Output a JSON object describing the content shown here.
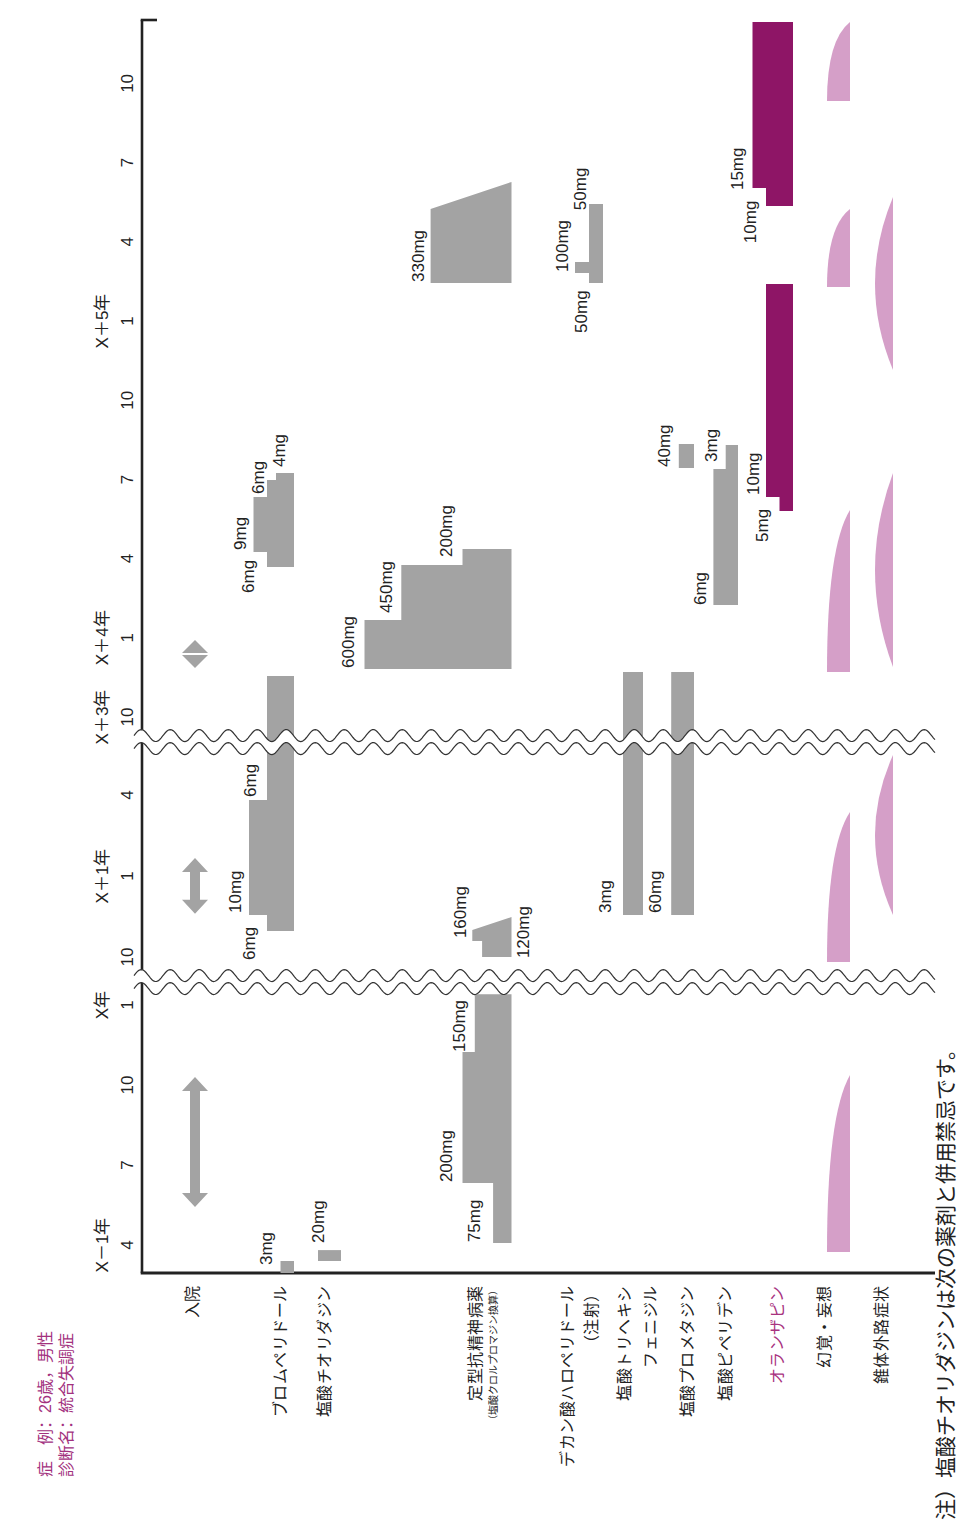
{
  "page": {
    "case_line": "症　例：26歳，男性",
    "diagnosis_line": "診断名：統合失調症",
    "note": "注）塩酸チオリダジンは次の薬剤と併用禁忌です。"
  },
  "chart_data": {
    "type": "bar",
    "subtype": "clinical-course-timeline",
    "xlabel": "",
    "ylabel": "",
    "colors": {
      "drug": "#a3a3a3",
      "olanzapine": "#8e1566",
      "symptom": "#d59fc8",
      "accent_text": "#a2317e",
      "axis": "#222222",
      "break_line": "#333333"
    },
    "time_axis": {
      "unit": "month",
      "range": [
        1.95,
        83.4
      ],
      "breaks": [
        [
          12.86,
          20.07
        ],
        [
          28.96,
          56.05
        ]
      ],
      "ticks": [
        {
          "t": 3,
          "month": "4",
          "year": "X－1年"
        },
        {
          "t": 6,
          "month": "7"
        },
        {
          "t": 9,
          "month": "10"
        },
        {
          "t": 12,
          "month": "1",
          "year": "X年"
        },
        {
          "t": 21,
          "month": "10"
        },
        {
          "t": 24,
          "month": "1",
          "year": "X＋1年"
        },
        {
          "t": 27,
          "month": "4"
        },
        {
          "t": 57,
          "month": "10",
          "year": "X＋3年"
        },
        {
          "t": 60,
          "month": "1",
          "year": "X＋4年"
        },
        {
          "t": 63,
          "month": "4"
        },
        {
          "t": 66,
          "month": "7"
        },
        {
          "t": 69,
          "month": "10"
        },
        {
          "t": 72,
          "month": "1",
          "year": "X＋5年"
        },
        {
          "t": 75,
          "month": "4"
        },
        {
          "t": 78,
          "month": "7"
        },
        {
          "t": 81,
          "month": "10"
        }
      ]
    },
    "rows": [
      {
        "id": "admission",
        "label_lines": [
          "入院"
        ],
        "kind": "arrow",
        "items": [
          {
            "t0": 4.43,
            "t1": 9.3
          },
          {
            "t0": 22.6,
            "t1": 24.67
          },
          {
            "t0": 58.86,
            "t1": 59.92
          }
        ]
      },
      {
        "id": "bromperidol",
        "label_lines": [
          "ブロムペリドール"
        ],
        "kind": "dose",
        "unit": "mg",
        "steps": [
          {
            "t0": 1.95,
            "t1": 2.4,
            "dose": 3
          },
          {
            "t0": 21.96,
            "t1": 22.56,
            "dose": 6
          },
          {
            "t0": 22.56,
            "t1": 26.81,
            "dose": 10
          },
          {
            "t0": 26.81,
            "t1": 58.55,
            "dose": 6
          },
          {
            "t0": 62.68,
            "t1": 63.25,
            "dose": 6
          },
          {
            "t0": 63.25,
            "t1": 65.33,
            "dose": 9
          },
          {
            "t0": 65.33,
            "t1": 65.98,
            "dose": 6
          },
          {
            "t0": 65.98,
            "t1": 66.24,
            "dose": 4
          }
        ],
        "labels": [
          {
            "text": "3mg",
            "t": 2.25,
            "level": 6.2
          },
          {
            "text": "6mg",
            "t": 20.89,
            "level": 10
          },
          {
            "text": "10mg",
            "t": 22.63,
            "level": 13.1
          },
          {
            "text": "6mg",
            "t": 26.93,
            "level": 9.8
          },
          {
            "text": "6mg",
            "t": 61.7,
            "level": 10.2
          },
          {
            "text": "9mg",
            "t": 63.33,
            "level": 12
          },
          {
            "text": "6mg",
            "t": 65.45,
            "level": 8
          },
          {
            "text": "4mg",
            "t": 66.47,
            "level": 3.3
          }
        ]
      },
      {
        "id": "thioridazine",
        "label_lines": [
          "塩酸チオリダジン"
        ],
        "kind": "dose",
        "unit": "mg",
        "steps": [
          {
            "t0": 2.4,
            "t1": 2.81,
            "dose": 20
          }
        ],
        "labels": [
          {
            "text": "20mg",
            "t": 3.08,
            "level": 20
          }
        ]
      },
      {
        "id": "typical-antipsychotics-cp-equivalent",
        "label_lines": [
          "定型抗精神病薬",
          "（塩酸クロルプロマジン換算）"
        ],
        "kind": "dose",
        "unit": "mg",
        "steps": [
          {
            "t0": 3.08,
            "t1": 5.33,
            "dose": 75
          },
          {
            "t0": 5.33,
            "t1": 10.24,
            "dose": 200
          },
          {
            "t0": 10.24,
            "t1": 12.4,
            "dose": 150
          },
          {
            "t0": 21.0,
            "t1": 21.59,
            "dose": 120
          },
          {
            "t0": 21.59,
            "t1": 22.0,
            "dose": 160
          },
          {
            "t0": 22.0,
            "t1": 22.48,
            "dose": 160,
            "dose_end": 0
          },
          {
            "t0": 58.82,
            "t1": 60.67,
            "dose": 600
          },
          {
            "t0": 60.67,
            "t1": 62.76,
            "dose": 450
          },
          {
            "t0": 62.76,
            "t1": 63.36,
            "dose": 200
          },
          {
            "t0": 73.44,
            "t1": 76.24,
            "dose": 330
          },
          {
            "t0": 76.24,
            "t1": 77.27,
            "dose": 330,
            "dose_end": 0
          }
        ],
        "labels": [
          {
            "text": "75mg",
            "t": 3.11,
            "level": 153
          },
          {
            "text": "200mg",
            "t": 5.36,
            "level": 267
          },
          {
            "text": "150mg",
            "t": 10.24,
            "level": 214
          },
          {
            "text": "120mg",
            "t": 20.96,
            "level": -47
          },
          {
            "text": "160mg",
            "t": 21.7,
            "level": 210
          },
          {
            "text": "600mg",
            "t": 58.86,
            "level": 667
          },
          {
            "text": "450mg",
            "t": 60.94,
            "level": 512
          },
          {
            "text": "200mg",
            "t": 63.06,
            "level": 267
          },
          {
            "text": "330mg",
            "t": 73.48,
            "level": 382
          }
        ]
      },
      {
        "id": "haloperidol-decanoate",
        "label_lines": [
          "デカン酸ハロペリドール",
          "（注射）"
        ],
        "kind": "dose",
        "unit": "mg",
        "steps": [
          {
            "t0": 73.44,
            "t1": 73.82,
            "dose": 50
          },
          {
            "t0": 73.82,
            "t1": 74.23,
            "dose": 100
          },
          {
            "t0": 74.23,
            "t1": 76.43,
            "dose": 50
          }
        ],
        "labels": [
          {
            "text": "50mg",
            "t": 71.55,
            "level": 79
          },
          {
            "text": "100mg",
            "t": 73.86,
            "level": 146
          },
          {
            "text": "50mg",
            "t": 76.2,
            "level": 82
          }
        ]
      },
      {
        "id": "trihexyphenidyl",
        "label_lines": [
          "塩酸トリヘキシ",
          "フェニジル"
        ],
        "kind": "dose",
        "unit": "mg",
        "steps": [
          {
            "t0": 22.56,
            "t1": 58.7,
            "dose": 3
          }
        ],
        "labels": [
          {
            "text": "3mg",
            "t": 22.63,
            "level": 5.7
          }
        ]
      },
      {
        "id": "promethazine",
        "label_lines": [
          "塩酸プロメタジン"
        ],
        "kind": "dose",
        "unit": "mg",
        "steps": [
          {
            "t0": 22.56,
            "t1": 58.7,
            "dose": 60
          },
          {
            "t0": 66.43,
            "t1": 67.34,
            "dose": 40
          }
        ],
        "labels": [
          {
            "text": "60mg",
            "t": 22.63,
            "level": 103
          },
          {
            "text": "40mg",
            "t": 66.47,
            "level": 79
          }
        ]
      },
      {
        "id": "biperiden",
        "label_lines": [
          "塩酸ピペリデン"
        ],
        "kind": "dose",
        "unit": "mg",
        "steps": [
          {
            "t0": 61.24,
            "t1": 66.39,
            "dose": 6
          },
          {
            "t0": 66.39,
            "t1": 67.3,
            "dose": 3
          }
        ],
        "labels": [
          {
            "text": "6mg",
            "t": 61.24,
            "level": 9.3
          },
          {
            "text": "3mg",
            "t": 66.66,
            "level": 6.6
          }
        ]
      },
      {
        "id": "olanzapine",
        "label_lines": [
          "オランザピン"
        ],
        "kind": "dose",
        "unit": "mg",
        "steps": [
          {
            "t0": 64.8,
            "t1": 65.33,
            "dose": 5
          },
          {
            "t0": 65.33,
            "t1": 73.4,
            "dose": 10
          },
          {
            "t0": 76.36,
            "t1": 77.04,
            "dose": 10
          },
          {
            "t0": 77.04,
            "t1": 83.33,
            "dose": 15
          }
        ],
        "labels": [
          {
            "text": "5mg",
            "t": 63.63,
            "level": 11.5
          },
          {
            "text": "10mg",
            "t": 65.41,
            "level": 14.8
          },
          {
            "text": "10mg",
            "t": 74.95,
            "level": 15.9
          },
          {
            "text": "15mg",
            "t": 76.96,
            "level": 20.7
          }
        ]
      },
      {
        "id": "hallucination-delusion",
        "label_lines": [
          "幻覚・妄想"
        ],
        "kind": "wedge",
        "items": [
          {
            "t0": 2.74,
            "t1": 9.38
          },
          {
            "t0": 20.81,
            "t1": 26.37
          },
          {
            "t0": 58.7,
            "t1": 64.84
          },
          {
            "t0": 73.29,
            "t1": 76.24
          },
          {
            "t0": 80.33,
            "t1": 83.33
          }
        ]
      },
      {
        "id": "extrapyramidal-symptoms",
        "label_lines": [
          "錐体外路症状"
        ],
        "kind": "lens",
        "items": [
          {
            "t0": 22.56,
            "t1": 28.48
          },
          {
            "t0": 58.89,
            "t1": 66.24
          },
          {
            "t0": 70.14,
            "t1": 76.7
          }
        ]
      }
    ]
  }
}
